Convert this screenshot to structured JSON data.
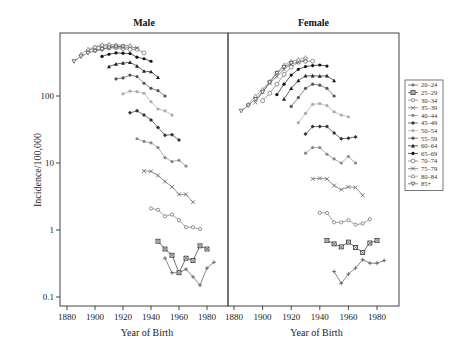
{
  "chart_data": {
    "type": "line",
    "yscale": "log",
    "ylabel": "Incidence/100,000",
    "xlabel": "Year of Birth",
    "ylim": [
      0.08,
      800
    ],
    "xlim": [
      1875,
      1995
    ],
    "yticks": [
      0.1,
      1,
      10,
      100
    ],
    "ytick_labels": [
      "0.1",
      "1",
      "10",
      "100"
    ],
    "xticks": [
      1880,
      1900,
      1920,
      1940,
      1960,
      1980
    ],
    "xtick_labels": [
      "1880",
      "1900",
      "1920",
      "1940",
      "1960",
      "1980"
    ],
    "grid": false,
    "legend_position": "right",
    "legend": [
      "20–24",
      "25–29",
      "30–34",
      "35–39",
      "40–44",
      "45–49",
      "50–54",
      "55–59",
      "60–64",
      "65–69",
      "70–74",
      "75–79",
      "80–84",
      "85+"
    ],
    "panels": [
      {
        "title": "Male",
        "series": [
          {
            "name": "20–24",
            "x": [
              1950,
              1955,
              1960,
              1965,
              1970,
              1975,
              1980,
              1985
            ],
            "values": [
              0.38,
              0.23,
              0.23,
              0.26,
              0.2,
              0.15,
              0.27,
              0.33
            ]
          },
          {
            "name": "25–29",
            "x": [
              1945,
              1950,
              1955,
              1960,
              1965,
              1970,
              1975,
              1980
            ],
            "values": [
              0.68,
              0.52,
              0.42,
              0.23,
              0.38,
              0.35,
              0.58,
              0.52
            ]
          },
          {
            "name": "30–34",
            "x": [
              1940,
              1945,
              1950,
              1955,
              1960,
              1965,
              1970,
              1975
            ],
            "values": [
              2.1,
              2.0,
              1.6,
              1.7,
              1.4,
              1.1,
              1.1,
              1.03
            ]
          },
          {
            "name": "35–39",
            "x": [
              1935,
              1940,
              1945,
              1950,
              1955,
              1960,
              1965,
              1970
            ],
            "values": [
              7.6,
              7.5,
              6.5,
              5.3,
              4.4,
              3.4,
              3.4,
              2.6
            ]
          },
          {
            "name": "40–44",
            "x": [
              1930,
              1935,
              1940,
              1945,
              1950,
              1955,
              1960,
              1965,
              1970
            ],
            "values": [
              23,
              21,
              20,
              17,
              12,
              10.5,
              11,
              9
            ]
          },
          {
            "name": "45–49",
            "x": [
              1925,
              1930,
              1935,
              1940,
              1945,
              1950,
              1955,
              1960,
              1965
            ],
            "values": [
              56,
              60,
              52,
              44,
              34,
              26,
              26.5,
              22
            ]
          },
          {
            "name": "50–54",
            "x": [
              1920,
              1925,
              1930,
              1935,
              1940,
              1945,
              1950,
              1955
            ],
            "values": [
              108,
              118,
              116,
              110,
              82,
              64,
              60,
              52
            ]
          },
          {
            "name": "55–59",
            "x": [
              1915,
              1920,
              1925,
              1930,
              1935,
              1940,
              1945,
              1950
            ],
            "values": [
              180,
              186,
              205,
              195,
              155,
              130,
              120,
              100
            ]
          },
          {
            "name": "60–64",
            "x": [
              1910,
              1915,
              1920,
              1925,
              1930,
              1935,
              1940,
              1945
            ],
            "values": [
              275,
              300,
              310,
              318,
              280,
              235,
              230,
              190
            ]
          },
          {
            "name": "65–69",
            "x": [
              1905,
              1910,
              1915,
              1920,
              1925,
              1930,
              1935,
              1940
            ],
            "values": [
              390,
              420,
              440,
              435,
              430,
              380,
              360,
              330
            ]
          },
          {
            "name": "70–74",
            "x": [
              1900,
              1905,
              1910,
              1915,
              1920,
              1925,
              1930,
              1935
            ],
            "values": [
              480,
              500,
              520,
              525,
              510,
              495,
              500,
              440
            ]
          },
          {
            "name": "75–79",
            "x": [
              1895,
              1900,
              1905,
              1910,
              1915,
              1920,
              1925,
              1930
            ],
            "values": [
              470,
              530,
              560,
              560,
              545,
              530,
              540,
              520
            ]
          },
          {
            "name": "80–84",
            "x": [
              1890,
              1895,
              1900,
              1905,
              1910,
              1915,
              1920,
              1925
            ],
            "values": [
              420,
              500,
              540,
              580,
              590,
              580,
              560,
              570
            ]
          },
          {
            "name": "85+",
            "x": [
              1885,
              1890,
              1895,
              1900,
              1905,
              1910,
              1915,
              1920
            ],
            "values": [
              330,
              390,
              440,
              470,
              500,
              530,
              545,
              550
            ]
          }
        ]
      },
      {
        "title": "Female",
        "series": [
          {
            "name": "20–24",
            "x": [
              1950,
              1955,
              1960,
              1965,
              1970,
              1975,
              1980,
              1985
            ],
            "values": [
              0.24,
              0.16,
              0.22,
              0.27,
              0.36,
              0.32,
              0.32,
              0.35
            ]
          },
          {
            "name": "25–29",
            "x": [
              1945,
              1950,
              1955,
              1960,
              1965,
              1970,
              1975,
              1980
            ],
            "values": [
              0.7,
              0.62,
              0.56,
              0.66,
              0.55,
              0.46,
              0.64,
              0.7
            ]
          },
          {
            "name": "30–34",
            "x": [
              1940,
              1945,
              1950,
              1955,
              1960,
              1965,
              1970,
              1975
            ],
            "values": [
              1.8,
              1.8,
              1.3,
              1.3,
              1.4,
              1.2,
              1.25,
              1.45
            ]
          },
          {
            "name": "35–39",
            "x": [
              1935,
              1940,
              1945,
              1950,
              1955,
              1960,
              1965,
              1970
            ],
            "values": [
              5.8,
              5.9,
              5.8,
              4.6,
              4.0,
              4.4,
              4.3,
              3.3
            ]
          },
          {
            "name": "40–44",
            "x": [
              1930,
              1935,
              1940,
              1945,
              1950,
              1955,
              1960,
              1965,
              1970
            ],
            "values": [
              14,
              17,
              17,
              13.5,
              11.5,
              10,
              12.5,
              10,
              null
            ]
          },
          {
            "name": "45–49",
            "x": [
              1930,
              1935,
              1940,
              1945,
              1950,
              1955,
              1960,
              1965
            ],
            "values": [
              27,
              35,
              35,
              35,
              28,
              23,
              23.5,
              24.5
            ]
          },
          {
            "name": "50–54",
            "x": [
              1925,
              1930,
              1935,
              1940,
              1945,
              1950,
              1955,
              1960
            ],
            "values": [
              40,
              55,
              75,
              77,
              72,
              58,
              52,
              49
            ]
          },
          {
            "name": "55–59",
            "x": [
              1920,
              1925,
              1930,
              1935,
              1940,
              1945,
              1950
            ],
            "values": [
              70,
              95,
              130,
              150,
              145,
              130,
              100
            ]
          },
          {
            "name": "60–64",
            "x": [
              1915,
              1920,
              1925,
              1930,
              1935,
              1940,
              1945,
              1950
            ],
            "values": [
              90,
              130,
              170,
              200,
              200,
              198,
              200,
              170
            ]
          },
          {
            "name": "65–69",
            "x": [
              1910,
              1915,
              1920,
              1925,
              1930,
              1935,
              1940,
              1945
            ],
            "values": [
              105,
              150,
              205,
              250,
              275,
              285,
              290,
              280
            ]
          },
          {
            "name": "70–74",
            "x": [
              1900,
              1905,
              1910,
              1915,
              1920,
              1925,
              1930,
              1935
            ],
            "values": [
              85,
              110,
              150,
              210,
              270,
              320,
              330,
              330
            ]
          },
          {
            "name": "75–79",
            "x": [
              1895,
              1900,
              1905,
              1910,
              1915,
              1920,
              1925,
              1930
            ],
            "values": [
              80,
              115,
              155,
              195,
              250,
              300,
              320,
              350
            ]
          },
          {
            "name": "80–84",
            "x": [
              1890,
              1895,
              1900,
              1905,
              1910,
              1915,
              1920,
              1925,
              1930
            ],
            "values": [
              75,
              100,
              125,
              165,
              225,
              290,
              330,
              350,
              375
            ]
          },
          {
            "name": "85+",
            "x": [
              1885,
              1890,
              1895,
              1900,
              1905,
              1910,
              1915,
              1920
            ],
            "values": [
              60,
              72,
              90,
              115,
              160,
              220,
              270,
              310
            ]
          }
        ]
      }
    ]
  },
  "styles": {
    "series_colors": [
      "#555555",
      "#333333",
      "#777777",
      "#666666",
      "#888888",
      "#333333",
      "#aaaaaa",
      "#555555",
      "#222222",
      "#111111",
      "#777777",
      "#666666",
      "#888888",
      "#555555"
    ],
    "series_markers": [
      "plus",
      "square-x",
      "circle",
      "x",
      "circle-filled",
      "diamond",
      "circle-filled",
      "circle-filled",
      "triangle",
      "circle-filled",
      "circle-open",
      "x",
      "triangle-open",
      "triangle-down"
    ]
  }
}
